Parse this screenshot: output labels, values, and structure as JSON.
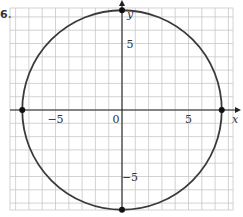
{
  "problem_label": "6.",
  "chart_data": {
    "type": "line",
    "title": "",
    "xlabel": "x",
    "ylabel": "y",
    "xlim": [
      -8.5,
      8.5
    ],
    "ylim": [
      -7.5,
      7.5
    ],
    "grid": true,
    "grid_step": 1,
    "x_ticks": [
      {
        "value": -5,
        "label": "−5"
      },
      {
        "value": 0,
        "label": "0"
      },
      {
        "value": 5,
        "label": "5"
      }
    ],
    "y_ticks": [
      {
        "value": 5,
        "label": "5"
      },
      {
        "value": -5,
        "label": "−5"
      }
    ],
    "series": [
      {
        "name": "circle",
        "shape": "circle",
        "center": [
          0,
          0
        ],
        "radius": 7.5,
        "color": "#3a3a3a"
      }
    ],
    "points": [
      {
        "x": 0,
        "y": 7.5,
        "label": ""
      },
      {
        "x": 0,
        "y": -7.5,
        "label": ""
      },
      {
        "x": -7.5,
        "y": 0,
        "label": ""
      },
      {
        "x": 7.5,
        "y": 0,
        "label": ""
      }
    ],
    "colors": {
      "grid": "#c8c8c8",
      "axis": "#222222",
      "curve": "#3a3a3a",
      "point": "#111111"
    }
  }
}
